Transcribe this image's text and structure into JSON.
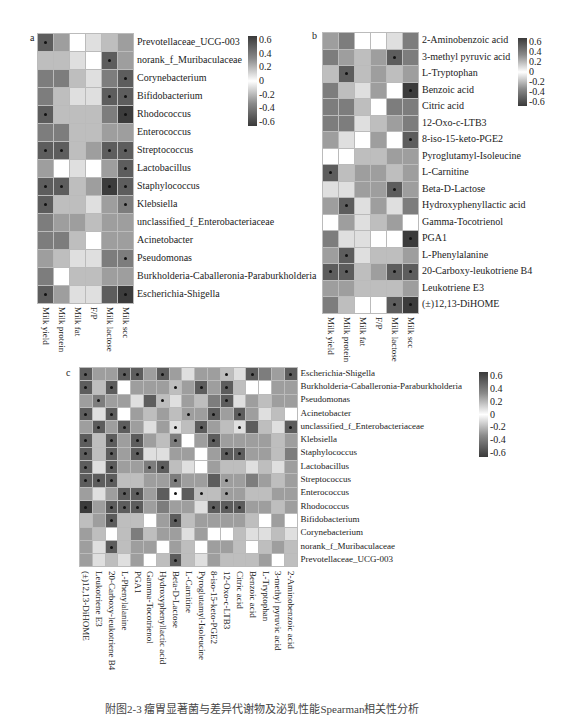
{
  "figure": {
    "caption": "附图2-3 瘤胃显著菌与差异代谢物及泌乳性能Spearman相关性分析"
  },
  "chart_data": [
    {
      "id": "a",
      "type": "heatmap",
      "panel_label": "a",
      "title": "",
      "columns": [
        "Milk yield",
        "Milk protein",
        "Milk fat",
        "F/P",
        "Milk lactose",
        "Milk scc"
      ],
      "rows": [
        "Prevotellaceae_UCG-003",
        "norank_f_Muribaculaceae",
        "Corynebacterium",
        "Bifidobacterium",
        "Rhodococcus",
        "Enterococcus",
        "Streptococcus",
        "Lactobacillus",
        "Staphylococcus",
        "Klebsiella",
        "unclassified_f_Enterobacteriaceae",
        "Acinetobacter",
        "Pseudomonas",
        "Burkholderia-Caballeronia-Paraburkholderia",
        "Escherichia-Shigella"
      ],
      "values": [
        [
          0.5,
          0.3,
          0.0,
          0.1,
          0.2,
          0.3
        ],
        [
          0.2,
          0.2,
          0.1,
          0.0,
          0.5,
          0.3
        ],
        [
          0.4,
          0.4,
          0.2,
          0.1,
          0.4,
          0.5
        ],
        [
          0.4,
          0.2,
          0.1,
          0.1,
          0.5,
          0.5
        ],
        [
          0.5,
          0.2,
          0.2,
          0.2,
          0.4,
          0.6
        ],
        [
          0.4,
          0.4,
          0.2,
          0.2,
          0.3,
          0.3
        ],
        [
          0.5,
          0.5,
          0.2,
          0.3,
          0.5,
          0.5
        ],
        [
          0.3,
          0.0,
          0.1,
          0.0,
          0.3,
          0.5
        ],
        [
          0.5,
          0.5,
          0.2,
          0.3,
          0.6,
          0.5
        ],
        [
          0.5,
          0.2,
          0.2,
          0.1,
          0.3,
          0.4
        ],
        [
          0.4,
          0.3,
          0.3,
          0.2,
          0.3,
          0.3
        ],
        [
          0.4,
          0.4,
          0.2,
          0.0,
          0.3,
          0.3
        ],
        [
          0.3,
          0.2,
          0.1,
          0.1,
          0.4,
          0.4
        ],
        [
          0.4,
          0.0,
          0.2,
          0.2,
          0.3,
          0.3
        ],
        [
          0.5,
          0.3,
          0.1,
          0.1,
          0.5,
          0.6
        ]
      ],
      "significant": [
        [
          0,
          0
        ],
        [
          1,
          4
        ],
        [
          2,
          5
        ],
        [
          3,
          4
        ],
        [
          3,
          5
        ],
        [
          4,
          0
        ],
        [
          4,
          5
        ],
        [
          6,
          0
        ],
        [
          6,
          1
        ],
        [
          6,
          4
        ],
        [
          6,
          5
        ],
        [
          7,
          5
        ],
        [
          8,
          0
        ],
        [
          8,
          1
        ],
        [
          8,
          4
        ],
        [
          8,
          5
        ],
        [
          9,
          0
        ],
        [
          9,
          5
        ],
        [
          12,
          5
        ],
        [
          14,
          0
        ],
        [
          14,
          5
        ]
      ],
      "colorbar": {
        "ticks": [
          "0.6",
          "0.4",
          "0.2",
          "0",
          "-0.2",
          "-0.4",
          "-0.6"
        ],
        "range": [
          -0.6,
          0.6
        ]
      },
      "xlabel": "",
      "ylabel": ""
    },
    {
      "id": "b",
      "type": "heatmap",
      "panel_label": "b",
      "title": "",
      "columns": [
        "Milk yield",
        "Milk protein",
        "Milk fat",
        "F/P",
        "Milk lactose",
        "Milk scc"
      ],
      "rows": [
        "2-Aminobenzoic acid",
        "3-methyl pyruvic acid",
        "L-Tryptophan",
        "Benzoic acid",
        "Citric acid",
        "12-Oxo-c-LTB3",
        "8-iso-15-keto-PGE2",
        "Pyroglutamyl-Isoleucine",
        "L-Carnitine",
        "Beta-D-Lactose",
        "Hydroxyphenyllactic acid",
        "Gamma-Tocotrienol",
        "PGA1",
        "L-Phenylalanine",
        "20-Carboxy-leukotriene B4",
        "Leukotriene E3",
        "(±)12,13-DiHOME"
      ],
      "values": [
        [
          0.3,
          0.4,
          0.0,
          0.0,
          0.1,
          0.4
        ],
        [
          0.4,
          0.3,
          0.2,
          0.3,
          0.5,
          0.4
        ],
        [
          0.2,
          0.5,
          0.2,
          0.3,
          0.2,
          0.3
        ],
        [
          0.4,
          0.2,
          0.1,
          0.3,
          0.0,
          0.6
        ],
        [
          0.4,
          0.4,
          0.2,
          0.0,
          0.4,
          0.4
        ],
        [
          0.4,
          0.4,
          0.1,
          0.2,
          0.3,
          0.4
        ],
        [
          0.3,
          0.1,
          0.0,
          0.3,
          0.0,
          0.5
        ],
        [
          0.0,
          0.0,
          0.2,
          0.2,
          0.3,
          0.3
        ],
        [
          0.5,
          0.2,
          0.3,
          0.3,
          0.2,
          0.3
        ],
        [
          0.1,
          0.1,
          0.3,
          0.3,
          0.5,
          0.3
        ],
        [
          0.3,
          0.5,
          0.1,
          0.3,
          0.1,
          0.4
        ],
        [
          0.0,
          0.3,
          0.1,
          0.2,
          0.3,
          0.0
        ],
        [
          0.4,
          0.1,
          0.1,
          0.0,
          0.0,
          0.6
        ],
        [
          0.3,
          0.5,
          0.1,
          0.2,
          0.2,
          0.3
        ],
        [
          0.5,
          0.5,
          0.2,
          0.3,
          0.5,
          0.5
        ],
        [
          0.3,
          0.3,
          0.2,
          0.2,
          0.2,
          0.3
        ],
        [
          0.4,
          0.2,
          0.0,
          0.0,
          0.5,
          0.6
        ]
      ],
      "significant": [
        [
          1,
          4
        ],
        [
          2,
          1
        ],
        [
          3,
          5
        ],
        [
          6,
          5
        ],
        [
          8,
          0
        ],
        [
          9,
          4
        ],
        [
          10,
          1
        ],
        [
          12,
          5
        ],
        [
          13,
          1
        ],
        [
          14,
          0
        ],
        [
          14,
          1
        ],
        [
          14,
          4
        ],
        [
          14,
          5
        ],
        [
          16,
          4
        ],
        [
          16,
          5
        ]
      ],
      "colorbar": {
        "ticks": [
          "0.6",
          "0.4",
          "0.2",
          "0",
          "-0.2",
          "-0.4",
          "-0.6"
        ],
        "range": [
          -0.6,
          0.6
        ]
      },
      "xlabel": "",
      "ylabel": ""
    },
    {
      "id": "c",
      "type": "heatmap",
      "panel_label": "c",
      "title": "",
      "columns": [
        "(±)12,13-DiHOME",
        "Leukotriene E3",
        "20-Carboxy-leukotriene B4",
        "L-Phenylalanine",
        "PGA1",
        "Gamma-Tocotrienol",
        "Hydroxyphenyllactic acid",
        "Beta-D-Lactose",
        "L-Carnitine",
        "Pyroglutamyl-Isoleucine",
        "8-iso-15-keto-PGE2",
        "12-Oxo-c-LTB3",
        "Citric acid",
        "Benzoic acid",
        "L-Tryptophan",
        "3-methyl pyruvic acid",
        "2-Aminobenzoic acid"
      ],
      "rows": [
        "Escherichia-Shigella",
        "Burkholderia-Caballeronia-Paraburkholderia",
        "Pseudomonas",
        "Acinetobacter",
        "unclassified_f_Enterobacteriaceae",
        "Klebsiella",
        "Staphylococcus",
        "Lactobacillus",
        "Streptococcus",
        "Enterococcus",
        "Rhodococcus",
        "Bifidobacterium",
        "Corynebacterium",
        "norank_f_Muribaculaceae",
        "Prevotellaceae_UCG-003"
      ],
      "values": [
        [
          0.5,
          0.3,
          0.3,
          0.5,
          0.5,
          0.3,
          0.5,
          0.3,
          0.1,
          0.3,
          0.3,
          0.2,
          0.1,
          0.5,
          0.4,
          0.3,
          0.5
        ],
        [
          0.5,
          0.2,
          0.5,
          0.0,
          0.3,
          0.3,
          0.3,
          0.2,
          0.3,
          0.5,
          0.3,
          0.5,
          0.2,
          0.0,
          0.0,
          0.3,
          0.3
        ],
        [
          0.3,
          0.4,
          0.3,
          0.3,
          0.1,
          0.5,
          0.2,
          0.1,
          0.3,
          0.2,
          0.4,
          0.5,
          0.1,
          0.3,
          0.2,
          0.3,
          0.3
        ],
        [
          0.5,
          0.1,
          0.5,
          0.0,
          0.3,
          0.2,
          0.3,
          0.2,
          0.3,
          0.3,
          0.5,
          0.3,
          0.5,
          0.3,
          0.1,
          0.2,
          0.0
        ],
        [
          0.3,
          0.5,
          0.3,
          0.5,
          0.3,
          0.1,
          0.3,
          0.1,
          0.2,
          0.5,
          0.3,
          0.2,
          0.1,
          0.5,
          0.2,
          0.1,
          0.5
        ],
        [
          0.5,
          0.2,
          0.5,
          0.3,
          0.5,
          0.3,
          0.2,
          0.4,
          0.0,
          0.3,
          0.5,
          0.3,
          0.3,
          0.3,
          0.3,
          0.2,
          0.3
        ],
        [
          0.5,
          0.2,
          0.5,
          0.3,
          0.5,
          0.1,
          0.1,
          0.3,
          0.3,
          0.0,
          0.3,
          0.5,
          0.5,
          0.3,
          0.3,
          0.2,
          0.4
        ],
        [
          0.5,
          0.1,
          0.5,
          0.3,
          0.3,
          0.4,
          0.5,
          0.2,
          0.1,
          0.0,
          0.3,
          0.2,
          0.2,
          0.1,
          0.2,
          0.1,
          0.3
        ],
        [
          0.5,
          0.5,
          0.5,
          0.2,
          0.2,
          0.3,
          0.3,
          0.4,
          0.3,
          0.3,
          0.5,
          0.3,
          0.3,
          0.4,
          0.3,
          0.2,
          0.3
        ],
        [
          0.3,
          0.1,
          0.3,
          0.5,
          0.5,
          0.3,
          0.5,
          0.0,
          0.5,
          0.2,
          0.2,
          0.3,
          0.3,
          0.2,
          0.2,
          0.3,
          0.3
        ],
        [
          0.6,
          0.3,
          0.5,
          0.5,
          0.5,
          0.3,
          0.4,
          0.3,
          0.3,
          0.1,
          0.5,
          0.5,
          0.5,
          0.3,
          0.3,
          0.2,
          0.3
        ],
        [
          0.2,
          0.3,
          0.5,
          0.2,
          0.2,
          0.0,
          0.3,
          0.5,
          0.2,
          0.3,
          0.3,
          0.3,
          0.3,
          0.2,
          0.0,
          0.3,
          0.0
        ],
        [
          0.3,
          0.2,
          0.0,
          0.2,
          0.4,
          0.2,
          0.3,
          0.3,
          0.1,
          0.3,
          0.0,
          0.0,
          0.2,
          0.1,
          0.1,
          0.2,
          0.1
        ],
        [
          0.3,
          0.1,
          0.5,
          0.2,
          0.3,
          0.3,
          0.0,
          0.3,
          0.2,
          0.0,
          0.3,
          0.3,
          0.2,
          0.0,
          0.2,
          0.3,
          0.2
        ],
        [
          0.3,
          0.1,
          0.2,
          0.1,
          0.3,
          0.0,
          0.2,
          0.5,
          0.2,
          0.1,
          0.3,
          0.2,
          0.2,
          0.2,
          0.3,
          0.0,
          0.2
        ]
      ],
      "significant": [
        [
          0,
          0
        ],
        [
          0,
          3
        ],
        [
          0,
          4
        ],
        [
          0,
          6
        ],
        [
          0,
          11
        ],
        [
          0,
          13
        ],
        [
          0,
          16
        ],
        [
          1,
          0
        ],
        [
          1,
          2
        ],
        [
          1,
          7
        ],
        [
          1,
          9
        ],
        [
          1,
          11
        ],
        [
          2,
          1
        ],
        [
          2,
          6
        ],
        [
          2,
          11
        ],
        [
          3,
          0
        ],
        [
          3,
          2
        ],
        [
          3,
          8
        ],
        [
          3,
          10
        ],
        [
          3,
          12
        ],
        [
          4,
          1
        ],
        [
          4,
          3
        ],
        [
          4,
          7
        ],
        [
          4,
          9
        ],
        [
          4,
          12
        ],
        [
          4,
          16
        ],
        [
          5,
          0
        ],
        [
          5,
          2
        ],
        [
          5,
          4
        ],
        [
          5,
          7
        ],
        [
          5,
          10
        ],
        [
          6,
          0
        ],
        [
          6,
          2
        ],
        [
          6,
          4
        ],
        [
          6,
          11
        ],
        [
          6,
          12
        ],
        [
          7,
          0
        ],
        [
          7,
          2
        ],
        [
          7,
          5
        ],
        [
          7,
          6
        ],
        [
          8,
          0
        ],
        [
          8,
          1
        ],
        [
          8,
          2
        ],
        [
          8,
          7
        ],
        [
          8,
          11
        ],
        [
          9,
          3
        ],
        [
          9,
          4
        ],
        [
          9,
          7
        ],
        [
          9,
          9
        ],
        [
          9,
          11
        ],
        [
          10,
          0
        ],
        [
          10,
          2
        ],
        [
          10,
          3
        ],
        [
          10,
          4
        ],
        [
          10,
          10
        ],
        [
          10,
          11
        ],
        [
          10,
          12
        ],
        [
          11,
          2
        ],
        [
          11,
          7
        ],
        [
          13,
          2
        ],
        [
          14,
          7
        ]
      ],
      "colorbar": {
        "ticks": [
          "0.6",
          "0.4",
          "0.2",
          "0",
          "-0.2",
          "-0.4",
          "-0.6"
        ],
        "range": [
          -0.6,
          0.6
        ]
      },
      "xlabel": "",
      "ylabel": ""
    }
  ]
}
